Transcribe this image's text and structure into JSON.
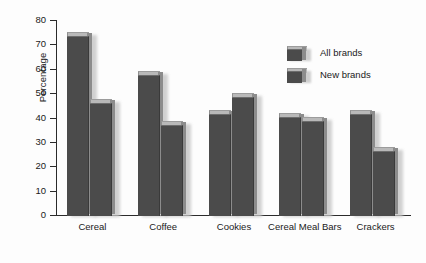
{
  "chart_data": {
    "type": "bar",
    "title": "",
    "xlabel": "",
    "ylabel": "Percentage",
    "ylim": [
      0,
      80
    ],
    "yticks": [
      0,
      10,
      20,
      30,
      40,
      50,
      60,
      70,
      80
    ],
    "grid": false,
    "legend_position": "top-right",
    "categories": [
      "Cereal",
      "Coffee",
      "Cookies",
      "Cereal Meal Bars",
      "Crackers"
    ],
    "series": [
      {
        "name": "All brands",
        "values": [
          73,
          57,
          41,
          40,
          41
        ]
      },
      {
        "name": "New brands",
        "values": [
          45.5,
          36.5,
          48,
          38,
          26
        ]
      }
    ],
    "colors": {
      "bar_face": "#4b4b4b",
      "bar_top": "#b9b9b9",
      "bar_side": "#8c8c8c",
      "axis": "#2b2b2b",
      "text": "#1a1a1a",
      "background": "#fdfdfd"
    }
  },
  "axis": {
    "y_title": "Percentage",
    "y_tick_labels": [
      "80",
      "70",
      "60",
      "50",
      "40",
      "30",
      "20",
      "10",
      "0"
    ],
    "x_tick_labels": [
      "Cereal",
      "Coffee",
      "Cookies",
      "Cereal Meal Bars",
      "Crackers"
    ]
  },
  "legend": {
    "items": [
      {
        "label": "All brands",
        "swatch": "bar-3d-swatch"
      },
      {
        "label": "New brands",
        "swatch": "bar-3d-swatch"
      }
    ]
  }
}
